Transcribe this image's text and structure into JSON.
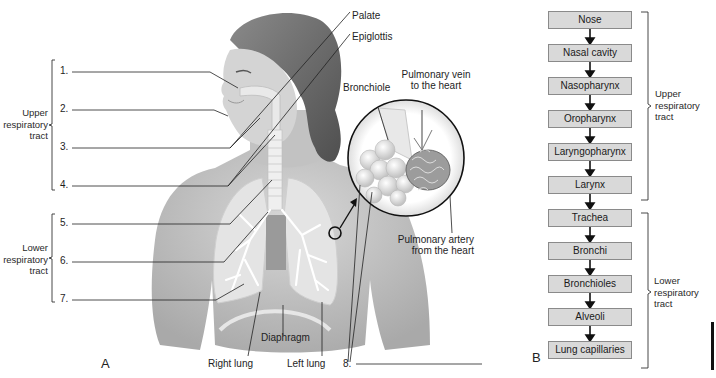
{
  "figure": {
    "panel_a": {
      "letter": "A",
      "upper_group_label": [
        "Upper",
        "respiratory",
        "tract"
      ],
      "lower_group_label": [
        "Lower",
        "respiratory",
        "tract"
      ],
      "numbered_blanks": [
        "1.",
        "2.",
        "3.",
        "4.",
        "5.",
        "6.",
        "7.",
        "8."
      ],
      "labels": {
        "palate": "Palate",
        "epiglottis": "Epiglottis",
        "bronchiole": "Bronchiole",
        "pulmonary_vein": [
          "Pulmonary vein",
          "to the heart"
        ],
        "pulmonary_artery": [
          "Pulmonary artery",
          "from the heart"
        ],
        "diaphragm": "Diaphragm",
        "right_lung": "Right lung",
        "left_lung": "Left lung"
      }
    },
    "panel_b": {
      "letter": "B",
      "flow": [
        "Nose",
        "Nasal cavity",
        "Nasopharynx",
        "Oropharynx",
        "Laryngopharynx",
        "Larynx",
        "Trachea",
        "Bronchi",
        "Bronchioles",
        "Alveoli",
        "Lung capillaries"
      ],
      "upper_group_label": [
        "Upper",
        "respiratory",
        "tract"
      ],
      "lower_group_label": [
        "Lower",
        "respiratory",
        "tract"
      ]
    },
    "colors": {
      "box_fill": "#d9d9d9",
      "box_border": "#8a8a8a",
      "skin": "#c8c8c8",
      "hair": "#6e6e6e",
      "lung": "#e4e4e4"
    }
  }
}
